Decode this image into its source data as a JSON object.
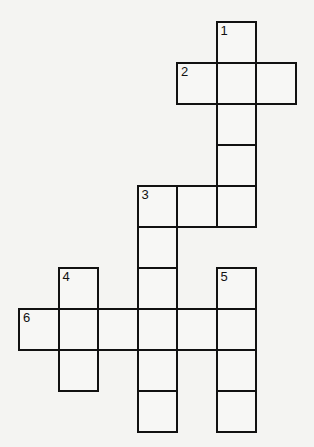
{
  "puzzle": {
    "type": "crossword",
    "grid": {
      "origin_x": 19,
      "origin_y": 22,
      "cell_w": 39.5,
      "cell_h": 41
    },
    "cells": [
      {
        "row": 0,
        "col": 5,
        "number": "1"
      },
      {
        "row": 1,
        "col": 4,
        "number": "2"
      },
      {
        "row": 1,
        "col": 5,
        "number": ""
      },
      {
        "row": 1,
        "col": 6,
        "number": ""
      },
      {
        "row": 2,
        "col": 5,
        "number": ""
      },
      {
        "row": 3,
        "col": 5,
        "number": ""
      },
      {
        "row": 4,
        "col": 3,
        "number": "3"
      },
      {
        "row": 4,
        "col": 4,
        "number": ""
      },
      {
        "row": 4,
        "col": 5,
        "number": ""
      },
      {
        "row": 5,
        "col": 3,
        "number": ""
      },
      {
        "row": 6,
        "col": 1,
        "number": "4"
      },
      {
        "row": 6,
        "col": 3,
        "number": ""
      },
      {
        "row": 6,
        "col": 5,
        "number": "5"
      },
      {
        "row": 7,
        "col": 0,
        "number": "6"
      },
      {
        "row": 7,
        "col": 1,
        "number": ""
      },
      {
        "row": 7,
        "col": 2,
        "number": ""
      },
      {
        "row": 7,
        "col": 3,
        "number": ""
      },
      {
        "row": 7,
        "col": 4,
        "number": ""
      },
      {
        "row": 7,
        "col": 5,
        "number": ""
      },
      {
        "row": 8,
        "col": 1,
        "number": ""
      },
      {
        "row": 8,
        "col": 3,
        "number": ""
      },
      {
        "row": 8,
        "col": 5,
        "number": ""
      },
      {
        "row": 9,
        "col": 3,
        "number": ""
      },
      {
        "row": 9,
        "col": 5,
        "number": ""
      }
    ],
    "entries": [
      {
        "number": "1",
        "direction": "down",
        "length": 5
      },
      {
        "number": "2",
        "direction": "across",
        "length": 3
      },
      {
        "number": "3",
        "direction": "across",
        "length": 3
      },
      {
        "number": "3",
        "direction": "down",
        "length": 6
      },
      {
        "number": "4",
        "direction": "down",
        "length": 3
      },
      {
        "number": "5",
        "direction": "down",
        "length": 4
      },
      {
        "number": "6",
        "direction": "across",
        "length": 6
      }
    ]
  }
}
